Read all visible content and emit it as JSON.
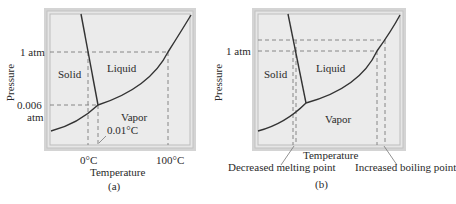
{
  "colors": {
    "frame_outer": "#cfcfcf",
    "frame_inner": "#e4e4e4",
    "plot_fill": "#e9e9e9",
    "curve": "#333333",
    "dashed": "#777777",
    "text": "#2a2a2a"
  },
  "panel_a": {
    "caption": "(a)",
    "y_axis_label": "Pressure",
    "x_axis_label": "Temperature",
    "y_ticks": [
      "1 atm",
      "0.006",
      "atm"
    ],
    "x_ticks": [
      "0°C",
      "100°C"
    ],
    "regions": {
      "solid": "Solid",
      "liquid": "Liquid",
      "vapor": "Vapor"
    },
    "annotation": "0.01°C"
  },
  "panel_b": {
    "caption": "(b)",
    "y_axis_label": "Pressure",
    "x_axis_label": "Temperature",
    "y_ticks": [
      "1 atm"
    ],
    "regions": {
      "solid": "Solid",
      "liquid": "Liquid",
      "vapor": "Vapor"
    },
    "annotations": {
      "melting": "Decreased melting point",
      "boiling": "Increased boiling point"
    }
  }
}
